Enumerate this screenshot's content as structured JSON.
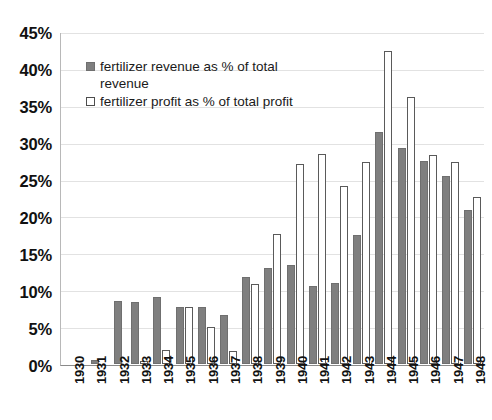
{
  "chart_data": {
    "type": "bar",
    "title": "",
    "subtitle": "",
    "xlabel": "",
    "ylabel": "",
    "ylim": [
      0,
      45
    ],
    "ytick_labels": [
      "45%",
      "40%",
      "35%",
      "30%",
      "25%",
      "20%",
      "15%",
      "10%",
      "5%",
      "0%"
    ],
    "ytick_values": [
      45,
      40,
      35,
      30,
      25,
      20,
      15,
      10,
      5,
      0
    ],
    "grid": true,
    "legend_position": "upper-left-inside",
    "categories": [
      "1930",
      "1931",
      "1932",
      "1933",
      "1934",
      "1935",
      "1936",
      "1937",
      "1938",
      "1939",
      "1940",
      "1941",
      "1942",
      "1943",
      "1944",
      "1945",
      "1946",
      "1947",
      "1948"
    ],
    "series": [
      {
        "name": "fertilizer revenue as % of total revenue",
        "color": "#7f7f7f",
        "values": [
          0,
          0.6,
          8.5,
          8.4,
          9.1,
          7.7,
          7.7,
          6.7,
          11.8,
          13.0,
          13.4,
          10.6,
          11.0,
          17.6,
          31.6,
          29.4,
          27.6,
          25.5,
          21.0
        ]
      },
      {
        "name": "fertilizer profit as % of total profit",
        "color": "#ffffff",
        "values": [
          0,
          0,
          0,
          0.4,
          1.9,
          7.8,
          5.1,
          1.8,
          10.9,
          17.7,
          27.2,
          28.6,
          24.2,
          27.5,
          42.5,
          36.3,
          28.4,
          27.5,
          22.7
        ]
      }
    ]
  },
  "legend": {
    "items": [
      {
        "label": "fertilizer revenue as % of total revenue",
        "swatch": "filled-gray-square"
      },
      {
        "label": "fertilizer profit as % of total profit",
        "swatch": "open-white-square"
      }
    ]
  }
}
